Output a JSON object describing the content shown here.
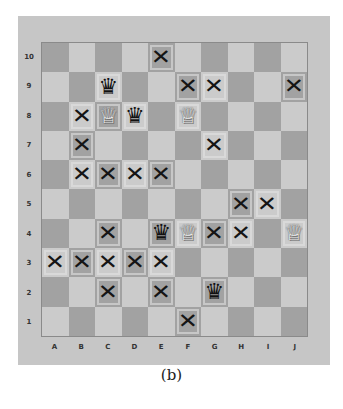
{
  "caption": "(b)",
  "files": [
    "A",
    "B",
    "C",
    "D",
    "E",
    "F",
    "G",
    "H",
    "I",
    "J"
  ],
  "ranks": [
    "10",
    "9",
    "8",
    "7",
    "6",
    "5",
    "4",
    "3",
    "2",
    "1"
  ],
  "colors": {
    "frame": "#c6c6c6",
    "dark_square": "#a2a2a2",
    "light_square": "#cbcbcb",
    "mark": "#151515"
  },
  "glyphs": {
    "X": "✕",
    "BQ": "♛",
    "WQ": "♕"
  },
  "board": [
    [
      "",
      "",
      "",
      "",
      "X",
      "",
      "",
      "",
      "",
      ""
    ],
    [
      "",
      "",
      "BQ",
      "",
      "",
      "X",
      "X",
      "",
      "",
      "X"
    ],
    [
      "",
      "X",
      "WQ",
      "BQ",
      "",
      "WQ",
      "",
      "",
      "",
      ""
    ],
    [
      "",
      "X",
      "",
      "",
      "",
      "",
      "X",
      "",
      "",
      ""
    ],
    [
      "",
      "X",
      "X",
      "X",
      "X",
      "",
      "",
      "",
      "",
      ""
    ],
    [
      "",
      "",
      "",
      "",
      "",
      "",
      "",
      "X",
      "X",
      ""
    ],
    [
      "",
      "",
      "X",
      "",
      "BQ",
      "WQ",
      "X",
      "X",
      "",
      "WQ"
    ],
    [
      "X",
      "X",
      "X",
      "X",
      "X",
      "",
      "",
      "",
      "",
      ""
    ],
    [
      "",
      "",
      "X",
      "",
      "X",
      "",
      "BQ",
      "",
      "",
      ""
    ],
    [
      "",
      "",
      "",
      "",
      "",
      "X",
      "",
      "",
      "",
      ""
    ]
  ]
}
